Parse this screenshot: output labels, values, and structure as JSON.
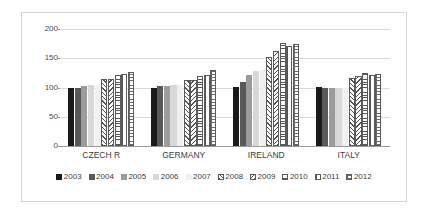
{
  "chart_data": {
    "type": "bar",
    "title": "",
    "subtitle": "",
    "xlabel": "",
    "ylabel": "",
    "ylim": [
      0,
      200
    ],
    "ytick_values": [
      0,
      50,
      100,
      150,
      200
    ],
    "ytick_labels": [
      "0",
      "50",
      "100",
      "150",
      "200"
    ],
    "grid": true,
    "legend_position": "bottom",
    "categories": [
      "CZECH R",
      "GERMANY",
      "IRELAND",
      "ITALY"
    ],
    "series": [
      {
        "name": "2003",
        "fill": "fill-solid-black",
        "color": "#1a1a1a",
        "values": [
          100,
          100,
          101,
          101
        ]
      },
      {
        "name": "2004",
        "fill": "fill-dark-gray",
        "color": "#595959",
        "values": [
          100,
          102,
          110,
          99
        ]
      },
      {
        "name": "2005",
        "fill": "fill-mid-gray",
        "color": "#9c9c9c",
        "values": [
          102,
          103,
          122,
          99
        ]
      },
      {
        "name": "2006",
        "fill": "fill-light-gray",
        "color": "#d8d8d8",
        "values": [
          104,
          105,
          128,
          100
        ]
      },
      {
        "name": "2007",
        "fill": "fill-pale-gray",
        "color": "#f0f0f0",
        "values": [
          104,
          105,
          130,
          100
        ]
      },
      {
        "name": "2008",
        "fill": "fill-diag-right",
        "color": "#ffffff",
        "values": [
          114,
          112,
          152,
          116
        ]
      },
      {
        "name": "2009",
        "fill": "fill-diag-left",
        "color": "#ffffff",
        "values": [
          115,
          112,
          163,
          120
        ]
      },
      {
        "name": "2010",
        "fill": "fill-horiz",
        "color": "#ffffff",
        "values": [
          121,
          119,
          176,
          124
        ]
      },
      {
        "name": "2011",
        "fill": "fill-vert",
        "color": "#ffffff",
        "values": [
          123,
          122,
          171,
          121
        ]
      },
      {
        "name": "2012",
        "fill": "fill-grid",
        "color": "#ffffff",
        "values": [
          127,
          130,
          174,
          123
        ]
      }
    ]
  },
  "axis": {
    "tick_0": "0",
    "tick_1": "50",
    "tick_2": "100",
    "tick_3": "150",
    "tick_4": "200"
  },
  "group_labels": {
    "g0": "CZECH R",
    "g1": "GERMANY",
    "g2": "IRELAND",
    "g3": "ITALY"
  },
  "legend": {
    "items": [
      {
        "label": "2003"
      },
      {
        "label": "2004"
      },
      {
        "label": "2005"
      },
      {
        "label": "2006"
      },
      {
        "label": "2007"
      },
      {
        "label": "2008"
      },
      {
        "label": "2009"
      },
      {
        "label": "2010"
      },
      {
        "label": "2011"
      },
      {
        "label": "2012"
      }
    ]
  },
  "colors": {
    "gridline": "#d9d9d9",
    "axis": "#9a9a9a",
    "frame": "#d4d4d4",
    "text": "#3d3d3d",
    "background": "#ffffff"
  }
}
